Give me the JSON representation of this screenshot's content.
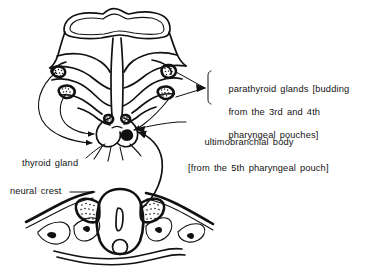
{
  "figure": {
    "background_color": "#ffffff",
    "ink_color": "#111111"
  },
  "labels": {
    "parathyroid": {
      "line1": "parathyroid glands [budding",
      "line2": "from the 3rd and 4th",
      "line3": "pharyngeal pouches]"
    },
    "ultimobranchial": {
      "line1": "ultimobranchial body",
      "line2": "[from the 5th pharyngeal pouch]"
    },
    "thyroid": "thyroid gland",
    "neural_crest": "neural crest"
  },
  "structures": {
    "pharyngeal_apparatus": "pharyngeal pouch apparatus",
    "thyroid_gland": "thyroid gland primordium",
    "ultimobranchial_body": "ultimobranchial body",
    "neural_tube": "neural tube cross-section",
    "neural_crest_cells": "neural crest cell mass",
    "notochord": "notochord",
    "migration_arrows": "cell migration arrows"
  }
}
